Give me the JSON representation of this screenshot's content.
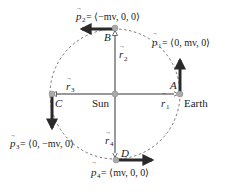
{
  "diagram": {
    "center_label": "Sun",
    "earth_label": "Earth",
    "points": {
      "A": "A",
      "B": "B",
      "C": "C",
      "D": "D"
    },
    "position_vectors": {
      "r1": "r",
      "r1_sub": "1",
      "r2": "r",
      "r2_sub": "2",
      "r3": "r",
      "r3_sub": "3",
      "r4": "r",
      "r4_sub": "4"
    },
    "momenta": {
      "p1": {
        "sym": "p",
        "sub": "1",
        "value": " = ⟨0, mv, 0⟩"
      },
      "p2": {
        "sym": "p",
        "sub": "2",
        "value": " = ⟨−mv, 0, 0⟩"
      },
      "p3": {
        "sym": "p",
        "sub": "3",
        "value": " = ⟨0, −mv, 0⟩"
      },
      "p4": {
        "sym": "p",
        "sub": "4",
        "value": " = ⟨mv, 0, 0⟩"
      }
    },
    "colors": {
      "line": "#333333",
      "arrow": "#2a2a2a",
      "orbit": "#666666",
      "dot": "#aaaaaa"
    }
  }
}
